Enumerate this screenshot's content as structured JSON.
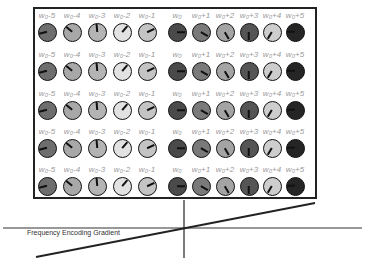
{
  "diagram": {
    "caption": "Frequency Encoding Gradient",
    "columns": [
      {
        "label": "w₀-5",
        "fill": "#6e6e6e",
        "angle": 165
      },
      {
        "label": "w₀-4",
        "fill": "#a8a8a8",
        "angle": 220
      },
      {
        "label": "w₀-3",
        "fill": "#b4b4b4",
        "angle": 265
      },
      {
        "label": "w₀-2",
        "fill": "#e2e2e2",
        "angle": 310
      },
      {
        "label": "w₀-1",
        "fill": "#c4c4c4",
        "angle": 335
      },
      {
        "label": "w₀",
        "fill": "#4a4a4a",
        "angle": 0
      },
      {
        "label": "w₀+1",
        "fill": "#7a7a7a",
        "angle": 30
      },
      {
        "label": "w₀+2",
        "fill": "#a4a4a4",
        "angle": 60
      },
      {
        "label": "w₀+3",
        "fill": "#555555",
        "angle": 90
      },
      {
        "label": "w₀+4",
        "fill": "#cdcdcd",
        "angle": 120
      },
      {
        "label": "w₀+5",
        "fill": "#252525",
        "angle": 180
      }
    ],
    "rows": 5
  }
}
